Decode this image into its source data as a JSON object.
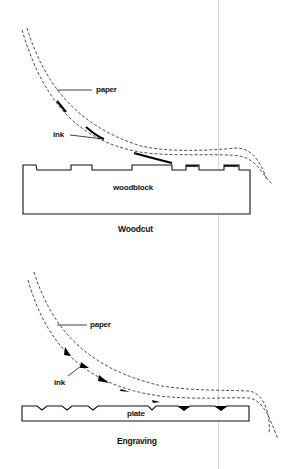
{
  "woodcut": {
    "labels": {
      "paper": "paper",
      "ink": "ink",
      "block": "woodblock"
    },
    "caption": "Woodcut"
  },
  "engraving": {
    "labels": {
      "paper": "paper",
      "ink": "ink",
      "plate": "plate"
    },
    "caption": "Engraving"
  }
}
